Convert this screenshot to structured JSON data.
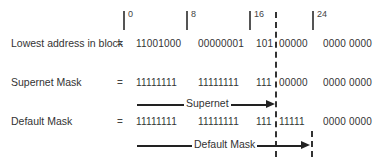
{
  "bit_markers": [
    {
      "label": "0",
      "x": 123
    },
    {
      "label": "8",
      "x": 186
    },
    {
      "label": "16",
      "x": 249
    },
    {
      "label": "24",
      "x": 312
    }
  ],
  "rows": [
    {
      "label": "Lowest address in block",
      "eq": "=",
      "octets": [
        "11001000",
        "00000001",
        "101",
        "00000",
        "0000 0000"
      ]
    },
    {
      "label": "Supernet Mask",
      "eq": "=",
      "octets": [
        "11111111",
        "11111111",
        "111",
        "00000",
        "0000 0000"
      ]
    },
    {
      "label": "Default Mask",
      "eq": "=",
      "octets": [
        "11111111",
        "11111111",
        "111",
        "11111",
        "0000 0000"
      ]
    }
  ],
  "arrows": {
    "supernet": {
      "label": "Supernet"
    },
    "default_mask": {
      "label": "Default Mask"
    }
  },
  "colors": {
    "line": "#222222",
    "text": "#333333"
  }
}
